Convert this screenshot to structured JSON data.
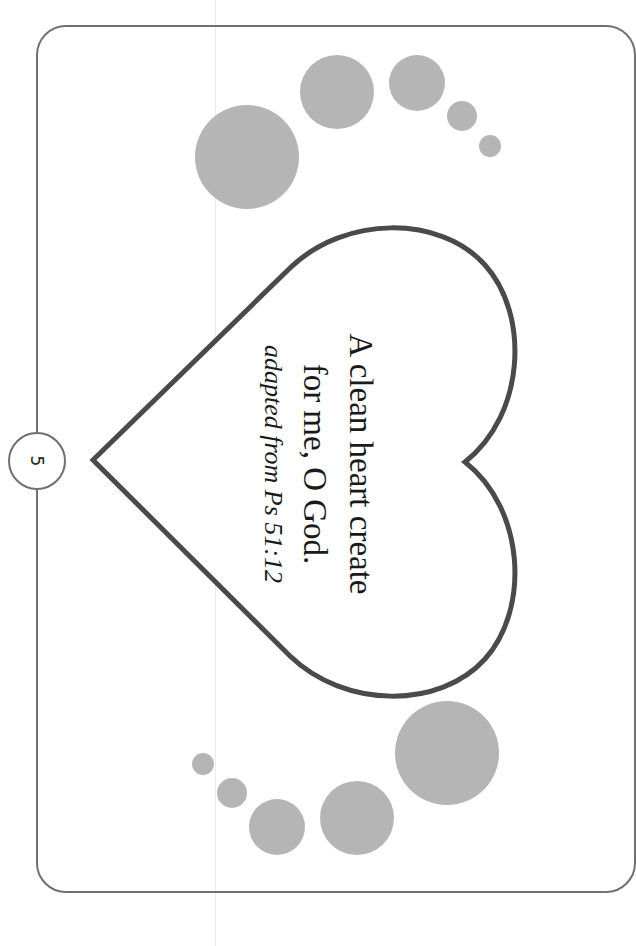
{
  "page": {
    "number": "5"
  },
  "verse": {
    "line1": "A clean heart create",
    "line2": "for me, O God.",
    "citation": "adapted from Ps 51:12"
  },
  "colors": {
    "frame": "#707070",
    "heart_stroke": "#4a4a4a",
    "dots": "#b5b5b5",
    "text": "#1a1a1a"
  },
  "decor": {
    "top_dots": [
      {
        "cx": 247,
        "cy": 157,
        "r": 52
      },
      {
        "cx": 337,
        "cy": 92,
        "r": 37
      },
      {
        "cx": 417,
        "cy": 83,
        "r": 28
      },
      {
        "cx": 462,
        "cy": 116,
        "r": 15
      },
      {
        "cx": 490,
        "cy": 146,
        "r": 11
      }
    ],
    "bottom_dots": [
      {
        "cx": 447,
        "cy": 753,
        "r": 52
      },
      {
        "cx": 357,
        "cy": 818,
        "r": 37
      },
      {
        "cx": 277,
        "cy": 827,
        "r": 28
      },
      {
        "cx": 232,
        "cy": 793,
        "r": 15
      },
      {
        "cx": 203,
        "cy": 764,
        "r": 11
      }
    ]
  }
}
